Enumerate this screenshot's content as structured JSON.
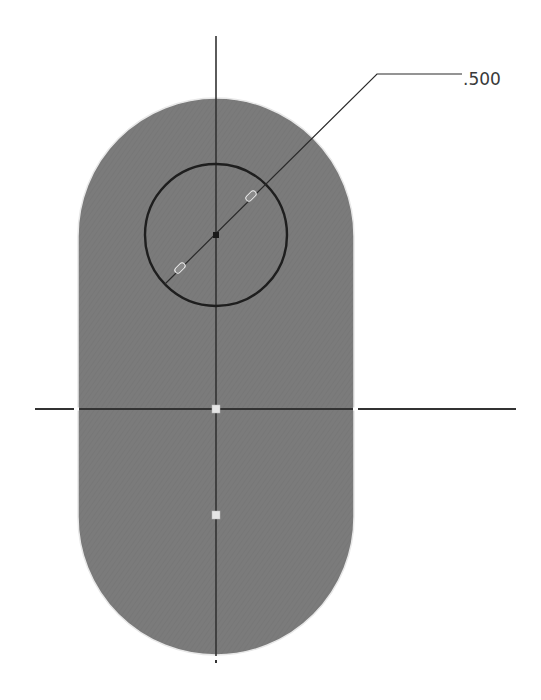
{
  "sketch": {
    "slot": {
      "fill": "#7b7b7b",
      "center_x": 216,
      "top_arc_center_y": 236,
      "bottom_arc_center_y": 517,
      "radius": 138
    },
    "hole": {
      "center_x": 216,
      "center_y": 235,
      "radius": 71,
      "stroke": "#1e1e1e"
    },
    "construction_lines": {
      "vertical": {
        "x": 216,
        "y1": 36,
        "y2": 656
      },
      "horizontal": {
        "y": 409,
        "x1": 35,
        "x2": 516
      },
      "color": "#333333"
    },
    "points": [
      {
        "name": "origin-point",
        "x": 216,
        "y": 409
      },
      {
        "name": "lower-arc-center-point",
        "x": 216,
        "y": 515
      }
    ],
    "dimension": {
      "label": ".500",
      "type": "diameter"
    }
  }
}
